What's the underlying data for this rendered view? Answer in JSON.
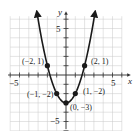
{
  "chart_data": {
    "type": "line",
    "title": "",
    "function": "y = x^2 - 3",
    "xlabel": "x",
    "ylabel": "y",
    "xlim": [
      -6,
      6
    ],
    "ylim": [
      -6,
      6
    ],
    "grid": true,
    "x_tick_labels": [
      {
        "value": -5,
        "label": "−5"
      },
      {
        "value": 5,
        "label": "5"
      }
    ],
    "y_tick_labels": [
      {
        "value": 5,
        "label": "5"
      },
      {
        "value": -5,
        "label": "−5"
      }
    ],
    "series": [
      {
        "name": "parabola",
        "curve_x_range": [
          -3.1,
          3.1
        ],
        "arrows_at_ends": true,
        "points": [
          {
            "x": -2,
            "y": 1,
            "label": "(−2, 1)"
          },
          {
            "x": -1,
            "y": -2,
            "label": "(−1, −2)"
          },
          {
            "x": 0,
            "y": -3,
            "label": "(0, −3)"
          },
          {
            "x": 1,
            "y": -2,
            "label": "(1, −2)"
          },
          {
            "x": 2,
            "y": 1,
            "label": "(2, 1)"
          }
        ]
      }
    ],
    "colors": {
      "grid": "#c8c8c8",
      "axis": "#333333",
      "curve": "#1a1a1a",
      "point": "#1a1a1a"
    }
  },
  "labels": {
    "x_axis": "x",
    "y_axis": "y",
    "x_tick_neg5": "−5",
    "x_tick_5": "5",
    "y_tick_5": "5",
    "y_tick_neg5": "−5",
    "pt_neg2_1": "(−2, 1)",
    "pt_2_1": "(2, 1)",
    "pt_neg1_neg2": "(−1, −2)",
    "pt_1_neg2": "(1, −2)",
    "pt_0_neg3": "(0, −3)"
  }
}
